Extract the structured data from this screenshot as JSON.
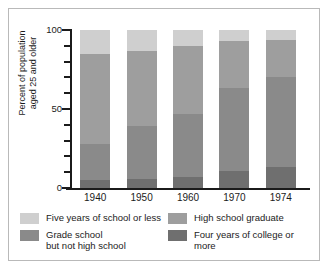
{
  "chart_data": {
    "type": "bar",
    "subtype": "stacked-bar-vertical-percent",
    "title": "",
    "xlabel": "",
    "ylabel": "Percent of population\naged 25 and older",
    "ylim": [
      0,
      100
    ],
    "yticks": [
      0,
      10,
      20,
      30,
      40,
      50,
      60,
      70,
      80,
      90,
      100
    ],
    "ytick_labels": [
      "0",
      "",
      "",
      "",
      "",
      "50",
      "",
      "",
      "",
      "",
      "100"
    ],
    "grid": false,
    "legend_position": "below-axes",
    "categories": [
      "1940",
      "1950",
      "1960",
      "1970",
      "1974"
    ],
    "stack_order_bottom_to_top": [
      "Four years of college or more",
      "Grade school but not high school",
      "High school graduate",
      "Five years of school or less"
    ],
    "series": [
      {
        "name": "Four years of college or more",
        "color": "#6f6f6f",
        "values": [
          5,
          6,
          7,
          11,
          13
        ]
      },
      {
        "name": "Grade school but not high school",
        "color": "#8a8a8a",
        "values": [
          23,
          33,
          40,
          52,
          57
        ]
      },
      {
        "name": "High school graduate",
        "color": "#9e9e9e",
        "values": [
          57,
          48,
          43,
          30,
          24
        ]
      },
      {
        "name": "Five years of school or less",
        "color": "#cfcfcf",
        "values": [
          15,
          13,
          10,
          7,
          6
        ]
      }
    ]
  },
  "axis": {
    "y_title_line1": "Percent of population",
    "y_title_line2": "aged 25 and older",
    "y_label_top": "100",
    "y_label_mid": "50",
    "y_label_bottom": "0"
  },
  "x_labels": [
    "1940",
    "1950",
    "1960",
    "1970",
    "1974"
  ],
  "legend": {
    "items": [
      {
        "label": "Five years of school or less",
        "color": "#cfcfcf"
      },
      {
        "label": "Grade school\nbut not high school",
        "color": "#8a8a8a"
      },
      {
        "label": "High school graduate",
        "color": "#9e9e9e"
      },
      {
        "label": "Four years of college or more",
        "color": "#6f6f6f"
      }
    ]
  },
  "colors": {
    "axis": "#1b1b1b",
    "frame": "#b9b9b9",
    "background": "#ffffff",
    "five_years_or_less": "#cfcfcf",
    "grade_school": "#8a8a8a",
    "high_school_graduate": "#9e9e9e",
    "college_four_plus": "#6f6f6f"
  }
}
